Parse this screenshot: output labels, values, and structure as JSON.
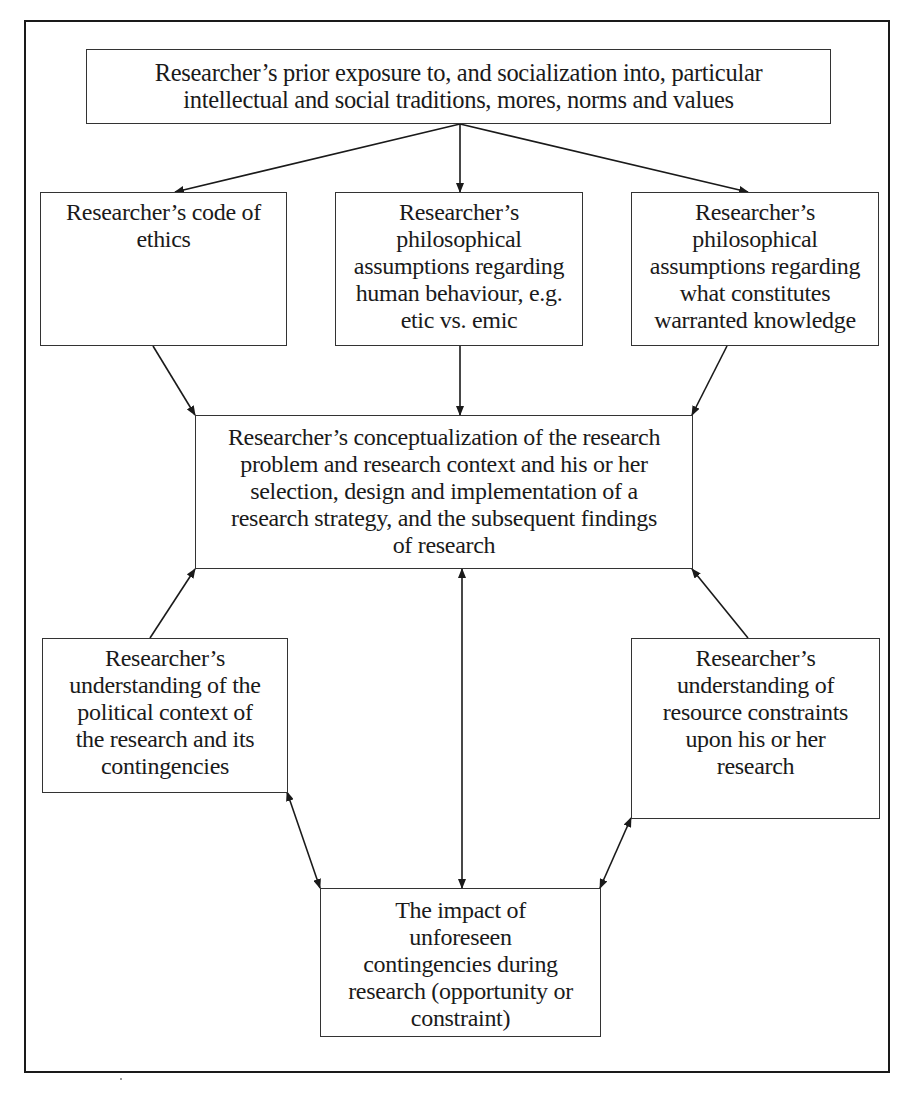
{
  "diagram": {
    "nodes": {
      "socialization": {
        "lines": [
          "Researcher’s prior exposure to, and socialization into, particular",
          "intellectual and social traditions, mores, norms and values"
        ]
      },
      "ethics": {
        "lines": [
          "Researcher’s code of",
          "ethics"
        ]
      },
      "human_behaviour": {
        "lines": [
          "Researcher’s",
          "philosophical",
          "assumptions regarding",
          "human behaviour, e.g.",
          "etic vs. emic"
        ]
      },
      "warranted_knowledge": {
        "lines": [
          "Researcher’s",
          "philosophical",
          "assumptions regarding",
          "what constitutes",
          "warranted knowledge"
        ]
      },
      "conceptualization": {
        "lines": [
          "Researcher’s conceptualization of the research",
          "problem and research context and his or her",
          "selection, design and implementation of a",
          "research strategy, and the subsequent findings",
          "of research"
        ]
      },
      "political_context": {
        "lines": [
          "Researcher’s",
          "understanding of the",
          "political context of",
          "the research and its",
          "contingencies"
        ]
      },
      "resource_constraints": {
        "lines": [
          "Researcher’s",
          "understanding of",
          "resource constraints",
          "upon his or her",
          "research"
        ]
      },
      "unforeseen": {
        "lines": [
          "The impact of",
          "unforeseen",
          "contingencies during",
          "research (opportunity or",
          "constraint)"
        ]
      }
    },
    "edges": [
      {
        "from": "socialization",
        "to": "ethics",
        "type": "directed"
      },
      {
        "from": "socialization",
        "to": "human_behaviour",
        "type": "directed"
      },
      {
        "from": "socialization",
        "to": "warranted_knowledge",
        "type": "directed"
      },
      {
        "from": "ethics",
        "to": "conceptualization",
        "type": "directed"
      },
      {
        "from": "human_behaviour",
        "to": "conceptualization",
        "type": "directed"
      },
      {
        "from": "warranted_knowledge",
        "to": "conceptualization",
        "type": "directed"
      },
      {
        "from": "political_context",
        "to": "conceptualization",
        "type": "directed"
      },
      {
        "from": "resource_constraints",
        "to": "conceptualization",
        "type": "directed"
      },
      {
        "from": "conceptualization",
        "to": "unforeseen",
        "type": "bidirectional"
      },
      {
        "from": "political_context",
        "to": "unforeseen",
        "type": "bidirectional"
      },
      {
        "from": "resource_constraints",
        "to": "unforeseen",
        "type": "bidirectional"
      }
    ],
    "colors": {
      "line": "#1a1a1a",
      "background": "#ffffff"
    }
  }
}
